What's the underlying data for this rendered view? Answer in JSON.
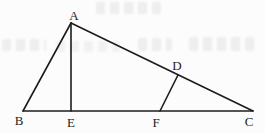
{
  "figure": {
    "background_color": "#fcfcfc",
    "line_color": "#1c1c1c",
    "line_width": 1.6,
    "label_color": "#1e1e1e",
    "artifact_color": "#e3e3e3",
    "points": {
      "A": {
        "x": 71,
        "y": 23
      },
      "B": {
        "x": 23,
        "y": 111
      },
      "C": {
        "x": 253,
        "y": 111
      },
      "D": {
        "x": 178,
        "y": 75
      },
      "E": {
        "x": 71,
        "y": 111
      },
      "F": {
        "x": 160,
        "y": 111
      }
    },
    "segments": [
      [
        "A",
        "B"
      ],
      [
        "B",
        "C"
      ],
      [
        "A",
        "C"
      ],
      [
        "A",
        "E"
      ],
      [
        "F",
        "D"
      ]
    ],
    "labels": {
      "A": "A",
      "B": "B",
      "C": "C",
      "D": "D",
      "E": "E",
      "F": "F"
    },
    "label_positions": {
      "A": {
        "x": 74,
        "y": 15
      },
      "B": {
        "x": 19,
        "y": 120
      },
      "C": {
        "x": 249,
        "y": 121
      },
      "D": {
        "x": 177,
        "y": 65
      },
      "E": {
        "x": 71,
        "y": 122
      },
      "F": {
        "x": 156,
        "y": 122
      }
    }
  }
}
